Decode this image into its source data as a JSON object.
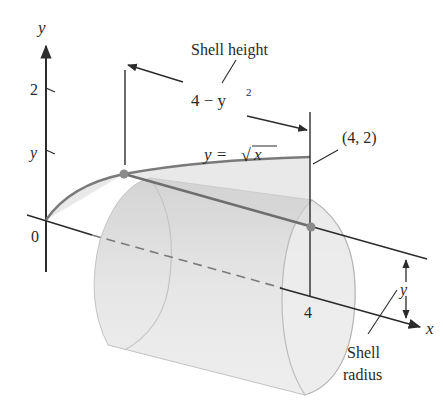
{
  "figure": {
    "labels": {
      "y_axis": "y",
      "x_axis": "x",
      "origin": "0",
      "y_tick_2": "2",
      "y_tick_y": "y",
      "x_tick_4": "4",
      "shell_height": "Shell height",
      "height_expr_main": "4 − y",
      "height_expr_exp": "2",
      "curve_lhs": "y = ",
      "curve_rhs": "x",
      "point": "(4, 2)",
      "radius_y": "y",
      "shell_radius_line1": "Shell",
      "shell_radius_line2": "radius"
    },
    "colors": {
      "axis": "#2b2b2b",
      "curve": "#7a7a7a",
      "cylinder_fill": "#d9d9d9",
      "cylinder_face": "#ececec",
      "cylinder_edge": "#b5b5b5",
      "point": "#8a8a8a",
      "text": "#2a2a2a"
    }
  }
}
